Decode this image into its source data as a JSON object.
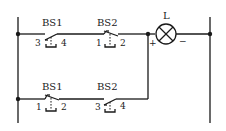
{
  "diagram": {
    "type": "electrical-schematic",
    "colors": {
      "line": "#1a1a1a",
      "background": "#ffffff",
      "text": "#222222"
    },
    "lamp": {
      "label": "L",
      "plus": "+",
      "minus": "−"
    },
    "rows": [
      {
        "name": "top-branch",
        "switches": [
          {
            "label": "BS1",
            "terminal_left": "3",
            "terminal_right": "4",
            "contact": "normally-open"
          },
          {
            "label": "BS2",
            "terminal_left": "1",
            "terminal_right": "2",
            "contact": "normally-closed"
          }
        ]
      },
      {
        "name": "bottom-branch",
        "switches": [
          {
            "label": "BS1",
            "terminal_left": "1",
            "terminal_right": "2",
            "contact": "normally-closed"
          },
          {
            "label": "BS2",
            "terminal_left": "3",
            "terminal_right": "4",
            "contact": "normally-open"
          }
        ]
      }
    ]
  }
}
